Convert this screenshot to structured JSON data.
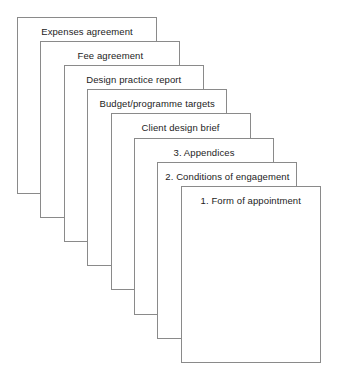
{
  "diagram": {
    "name": "document-stack",
    "type": "stacked-cards",
    "canvas": {
      "width": 338,
      "height": 378,
      "background": "#ffffff"
    },
    "style": {
      "card_width": 140,
      "card_height": 177,
      "offset_x": 23.4,
      "offset_y": 24.1,
      "origin_x": 17,
      "origin_y": 17,
      "border_color": "#8a8a8a",
      "fill_color": "#ffffff",
      "text_color": "#1c1c1c",
      "font_size_px": 9.5
    },
    "cards": [
      {
        "id": "card-expenses-agreement",
        "label": "Expenses agreement",
        "depth": 8,
        "z": 1
      },
      {
        "id": "card-fee-agreement",
        "label": "Fee agreement",
        "depth": 7,
        "z": 2
      },
      {
        "id": "card-design-practice-report",
        "label": "Design practice report",
        "depth": 6,
        "z": 3
      },
      {
        "id": "card-budget-programme-targets",
        "label": "Budget/programme targets",
        "depth": 5,
        "z": 4
      },
      {
        "id": "card-client-design-brief",
        "label": "Client design brief",
        "depth": 4,
        "z": 5
      },
      {
        "id": "card-appendices",
        "label": "3. Appendices",
        "depth": 3,
        "z": 6
      },
      {
        "id": "card-conditions-of-engagement",
        "label": "2. Conditions of engagement",
        "depth": 2,
        "z": 7
      },
      {
        "id": "card-form-of-appointment",
        "label": "1. Form of appointment",
        "depth": 1,
        "z": 8
      }
    ]
  }
}
